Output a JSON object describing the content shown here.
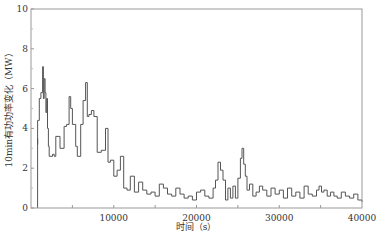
{
  "chart_data": {
    "type": "line",
    "title": "",
    "xlabel": "时间（s）",
    "ylabel": "10min有功功率变化（MW）",
    "xlim": [
      0,
      40000
    ],
    "ylim": [
      0,
      10
    ],
    "xticks": [
      10000,
      20000,
      30000,
      40000
    ],
    "xtick_labels": [
      "10000",
      "20000",
      "30000",
      "40000"
    ],
    "yticks": [
      0,
      2,
      4,
      6,
      8,
      10
    ],
    "ytick_labels": [
      "0",
      "2",
      "4",
      "6",
      "8",
      "10"
    ],
    "grid": false,
    "legend": null,
    "line_color": "#555555",
    "series": [
      {
        "name": "10min有功功率变化",
        "step": true,
        "x": [
          0,
          300,
          600,
          800,
          1000,
          1200,
          1400,
          1500,
          1600,
          1700,
          1800,
          1900,
          2000,
          2100,
          2200,
          2400,
          2600,
          2800,
          3000,
          3500,
          4000,
          4300,
          4600,
          4800,
          5000,
          5200,
          5400,
          5600,
          6000,
          6300,
          6600,
          6800,
          7000,
          7300,
          7600,
          8000,
          8500,
          9000,
          9300,
          9600,
          10000,
          10400,
          10800,
          11200,
          11600,
          12000,
          12500,
          13000,
          13500,
          14000,
          14500,
          15000,
          15500,
          16000,
          16500,
          17000,
          17500,
          18000,
          18500,
          19000,
          19500,
          20000,
          20500,
          21000,
          21500,
          22000,
          22300,
          22600,
          22900,
          23200,
          23500,
          23800,
          24100,
          24400,
          24700,
          25000,
          25300,
          25500,
          25700,
          25900,
          26100,
          26400,
          26800,
          27200,
          27600,
          28000,
          28500,
          29000,
          29500,
          30000,
          30500,
          31000,
          31500,
          32000,
          32500,
          33000,
          33500,
          34000,
          34500,
          34800,
          35100,
          35400,
          35800,
          36200,
          36600,
          37000,
          37500,
          38000,
          38500,
          39000,
          39500,
          40000
        ],
        "y": [
          3.5,
          3.2,
          3.5,
          4.4,
          5.5,
          5.8,
          7.1,
          5.5,
          6.5,
          5.8,
          4.8,
          5.5,
          4.0,
          3.1,
          2.6,
          2.6,
          2.7,
          2.6,
          3.6,
          3.0,
          4.1,
          4.2,
          5.6,
          5.0,
          4.2,
          4.2,
          3.1,
          2.6,
          4.2,
          5.4,
          6.3,
          4.6,
          4.7,
          4.9,
          4.6,
          2.8,
          2.9,
          4.0,
          2.3,
          2.4,
          1.6,
          1.9,
          2.6,
          1.0,
          0.9,
          1.6,
          0.8,
          1.3,
          0.9,
          0.7,
          0.8,
          0.6,
          1.2,
          1.0,
          0.7,
          0.6,
          1.0,
          0.7,
          0.5,
          0.6,
          0.4,
          0.8,
          0.9,
          0.6,
          0.5,
          1.0,
          1.4,
          2.3,
          1.9,
          1.4,
          0.4,
          1.0,
          0.5,
          1.1,
          0.5,
          1.5,
          2.5,
          3.0,
          2.2,
          1.6,
          0.9,
          1.2,
          0.6,
          0.8,
          1.1,
          0.9,
          0.6,
          1.0,
          0.7,
          0.9,
          0.5,
          1.0,
          0.6,
          0.8,
          0.5,
          1.1,
          0.7,
          0.6,
          0.9,
          1.1,
          0.8,
          0.9,
          0.6,
          0.8,
          0.6,
          0.5,
          0.8,
          0.6,
          0.5,
          0.7,
          0.4,
          0.3
        ]
      }
    ]
  }
}
